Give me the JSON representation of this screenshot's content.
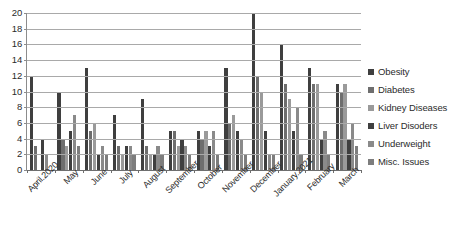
{
  "chart_data": {
    "type": "bar",
    "title": "",
    "subtitle": "",
    "xlabel": "",
    "ylabel": "",
    "ylim": [
      0,
      20
    ],
    "ytick_step": 2,
    "yticks": [
      20,
      18,
      16,
      14,
      12,
      10,
      8,
      6,
      4,
      2,
      0
    ],
    "grid": true,
    "legend_position": "right",
    "categories": [
      "April.2020",
      "May",
      "June",
      "July",
      "August",
      "September",
      "October",
      "November",
      "December",
      "January.2021",
      "February",
      "March"
    ],
    "series": [
      {
        "name": "Obesity",
        "color": "#3f3f3f",
        "values": [
          12,
          10,
          13,
          7,
          9,
          5,
          5,
          13,
          20,
          16,
          13,
          11
        ]
      },
      {
        "name": "Diabetes",
        "color": "#6e6e6e",
        "values": [
          3,
          4,
          5,
          3,
          3,
          5,
          4,
          6,
          12,
          11,
          11,
          10
        ]
      },
      {
        "name": "Kidney Diseases",
        "color": "#9a9a9a",
        "values": [
          0,
          3,
          6,
          2,
          2,
          3,
          5,
          7,
          10,
          9,
          11,
          11
        ]
      },
      {
        "name": "Liver Disoders",
        "color": "#3f3f3f",
        "values": [
          4,
          5,
          2,
          3,
          2,
          4,
          3,
          5,
          5,
          5,
          4,
          4
        ]
      },
      {
        "name": "Underweight",
        "color": "#8a8a8a",
        "values": [
          2,
          7,
          3,
          3,
          3,
          3,
          5,
          4,
          2,
          8,
          5,
          6
        ]
      },
      {
        "name": "Misc. Issues",
        "color": "#7d7d7d",
        "values": [
          0,
          3,
          2,
          2,
          2,
          2,
          2,
          2,
          2,
          2,
          2,
          3
        ]
      }
    ]
  },
  "legend": {
    "items": [
      {
        "label": "Obesity"
      },
      {
        "label": "Diabetes"
      },
      {
        "label": "Kidney Diseases"
      },
      {
        "label": "Liver Disoders"
      },
      {
        "label": "Underweight"
      },
      {
        "label": "Misc. Issues"
      }
    ]
  },
  "colors": {
    "axis": "#6e6e6e",
    "grid": "#a9a9a9",
    "text": "#2b2b2b",
    "background": "#ffffff"
  }
}
